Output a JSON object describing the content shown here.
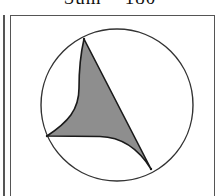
{
  "caption": {
    "text": "Sum = 180"
  },
  "figure": {
    "circle": {
      "cx": 117,
      "cy": 105,
      "r": 76,
      "stroke": "#333333"
    },
    "shape": {
      "fill": "#8e8e8e",
      "stroke": "#1a1a1a",
      "vertices": [
        {
          "name": "top",
          "x": 84,
          "y": 39
        },
        {
          "name": "left",
          "x": 47,
          "y": 136
        },
        {
          "name": "bottom-right",
          "x": 151,
          "y": 169
        }
      ],
      "edges": [
        {
          "from": "top",
          "to": "bottom-right",
          "kind": "straight"
        },
        {
          "from": "top",
          "to": "left",
          "kind": "concave-curve"
        },
        {
          "from": "left",
          "to": "bottom-right",
          "kind": "concave-curve"
        }
      ]
    }
  }
}
